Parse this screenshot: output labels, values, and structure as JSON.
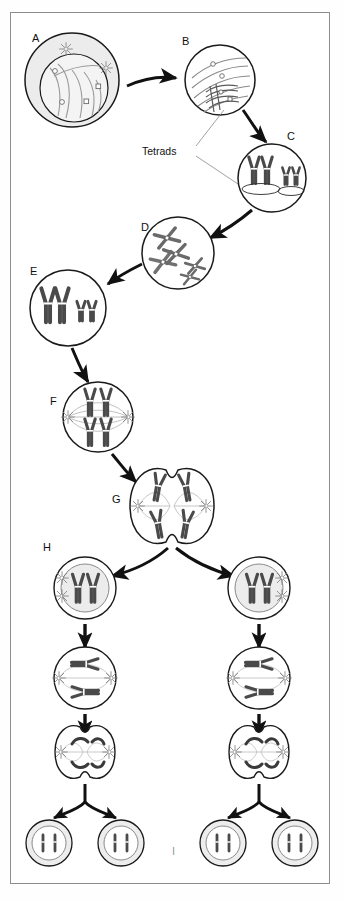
{
  "figure": {
    "border_color": "#8d8d8d",
    "background": "#ffffff",
    "ink_color": "#1a1a1a",
    "chromosome_fill": "#4a4a4a",
    "cytoplasm_fill": "#ebebeb",
    "spindle_color": "#a9a9a9"
  },
  "annotations": {
    "tetrads_label": "Tetrads"
  },
  "stages": [
    {
      "id": "A",
      "label": "A",
      "label_x": 32,
      "label_y": 33,
      "cx": 72,
      "cy": 80,
      "r": 47,
      "name": "interphase-cell",
      "description": "Interphase: chromatin threads, two asters, nuclear envelope"
    },
    {
      "id": "B",
      "label": "B",
      "label_x": 182,
      "label_y": 36,
      "cx": 220,
      "cy": 80,
      "r": 35,
      "name": "prophase-i-cell",
      "description": "Prophase I: chromatin condensing, tetrads forming"
    },
    {
      "id": "C",
      "label": "C",
      "label_x": 287,
      "label_y": 131,
      "cx": 272,
      "cy": 178,
      "r": 34,
      "name": "tetrad-cell",
      "description": "Tetrads fully formed, synapsed homologous pairs"
    },
    {
      "id": "D",
      "label": "D",
      "label_x": 141,
      "label_y": 222,
      "cx": 178,
      "cy": 253,
      "r": 36,
      "name": "crossing-over-cell",
      "description": "Crossing over between homologues"
    },
    {
      "id": "E",
      "label": "E",
      "label_x": 30,
      "label_y": 266,
      "cx": 68,
      "cy": 308,
      "r": 38,
      "name": "separated-pairs-cell",
      "description": "Homologous pairs separated and condensed"
    },
    {
      "id": "F",
      "label": "F",
      "label_x": 50,
      "label_y": 396,
      "cx": 98,
      "cy": 417,
      "r": 35,
      "name": "metaphase-i-cell",
      "description": "Metaphase I: pairs aligned on spindle equator"
    },
    {
      "id": "G",
      "label": "G",
      "label_x": 112,
      "label_y": 494,
      "cx": 172,
      "cy": 506,
      "r": 42,
      "name": "telophase-i-cell",
      "description": "Telophase I / cytokinesis: cell cleaving in two"
    },
    {
      "id": "H",
      "label": "H",
      "label_x": 43,
      "label_y": 542,
      "cx": 85,
      "cy": 588,
      "r": 31,
      "name": "daughter-cell-left",
      "description": "Daughter cell after meiosis I (haploid, duplicated)"
    },
    {
      "id": "I",
      "label": "I",
      "label_x": 172,
      "label_y": 846,
      "cx": 0,
      "cy": 0,
      "r": 0,
      "name": "gamete-row-label",
      "description": "Four haploid gametes produced"
    }
  ],
  "meiosis_two": {
    "left_column_x": 85,
    "right_column_x": 259,
    "metaphase_ii_y": 678,
    "telophase_ii_y": 752,
    "gamete_y": 843,
    "gamete_offsets": [
      -36,
      36
    ],
    "gamete_r": 23
  }
}
